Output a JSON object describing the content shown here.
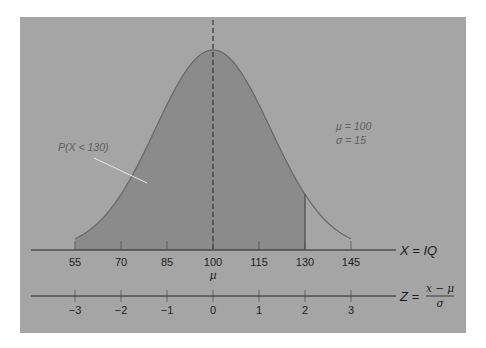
{
  "chart_data": {
    "type": "area",
    "title": "",
    "distribution": {
      "mean": 100,
      "sd": 15
    },
    "shaded_region": {
      "from": 55,
      "to": 130,
      "label": "P(X < 130)"
    },
    "x_axis": {
      "label": "X = IQ",
      "ticks": [
        55,
        70,
        85,
        100,
        115,
        130,
        145
      ],
      "tick_labels": [
        "55",
        "70",
        "85",
        "100",
        "115",
        "130",
        "145"
      ],
      "sub_label_at_100": "μ",
      "range": [
        55,
        145
      ]
    },
    "z_axis": {
      "label_prefix": "Z =",
      "label_numerator": "x − μ",
      "label_denominator": "σ",
      "ticks": [
        -3,
        -2,
        -1,
        0,
        1,
        2,
        3
      ],
      "tick_labels": [
        "−3",
        "−2",
        "−1",
        "0",
        "1",
        "2",
        "3"
      ]
    },
    "annotations": {
      "params_line1": "μ = 100",
      "params_line2": "σ = 15",
      "area_label": "P(X < 130)"
    },
    "mean_line": {
      "x": 100,
      "style": "dashed"
    },
    "grid": false,
    "legend": "none"
  },
  "colors": {
    "panel_bg": "#a5a5a5",
    "shaded_fill": "#8b8b8b",
    "curve_stroke": "#6a6a6a",
    "axis": "#222222",
    "pointer": "#e6e6e6"
  }
}
